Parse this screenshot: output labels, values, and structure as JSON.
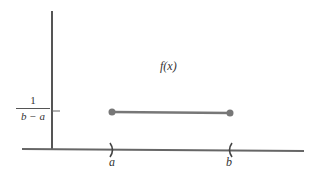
{
  "diagram": {
    "function_label": "f(x)",
    "y_tick_label": {
      "numerator": "1",
      "denominator": "b − a"
    },
    "x_labels": {
      "a": "a",
      "b": "b"
    },
    "colors": {
      "axis": "#555555",
      "segment": "#777777",
      "text": "#333333"
    }
  }
}
